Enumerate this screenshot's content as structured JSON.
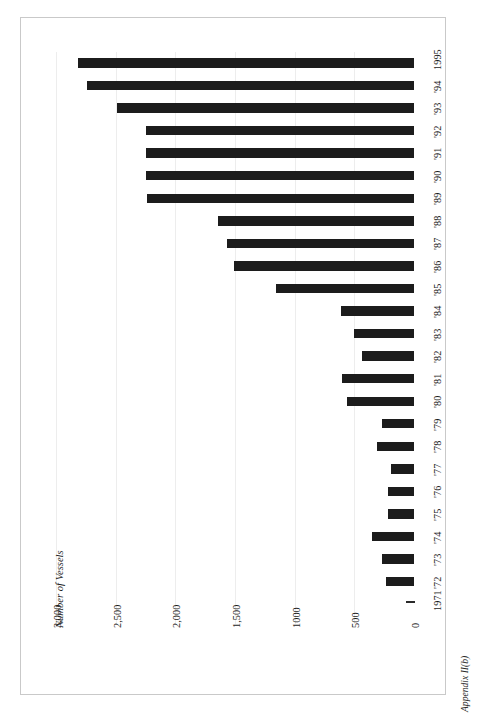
{
  "figure": {
    "caption": "Appendix II(b)",
    "orientation": "landscape-rotated"
  },
  "chart_data": {
    "type": "bar",
    "orientation": "horizontal",
    "title": "",
    "xlabel": "",
    "ylabel": "Number of Vessels",
    "axis_title": "Number of Vessels",
    "grid": true,
    "legend": "none",
    "value_axis": {
      "ticks": [
        0,
        500,
        1000,
        1500,
        2000,
        2500,
        3000
      ],
      "tick_labels": [
        "0",
        "500",
        "1000",
        "1,500",
        "2,000",
        "2,500",
        "3,000"
      ],
      "range": [
        0,
        3000
      ]
    },
    "categories": [
      "1995",
      "'94",
      "'93",
      "'92",
      "'91",
      "'90",
      "'89",
      "'88",
      "'87",
      "'86",
      "'85",
      "'84",
      "'83",
      "'82",
      "'81",
      "'80",
      "'79",
      "'78",
      "'77",
      "'76",
      "'75",
      "'74",
      "'73",
      "'72",
      "1971"
    ],
    "values": [
      2815,
      2740,
      2490,
      2250,
      2250,
      2250,
      2240,
      1640,
      1570,
      1505,
      1160,
      615,
      505,
      437,
      605,
      563,
      270,
      310,
      193,
      218,
      218,
      353,
      270,
      235,
      0
    ],
    "bar_color": "#1c1c1c",
    "grid_color": "#ededed",
    "background": "#ffffff"
  }
}
